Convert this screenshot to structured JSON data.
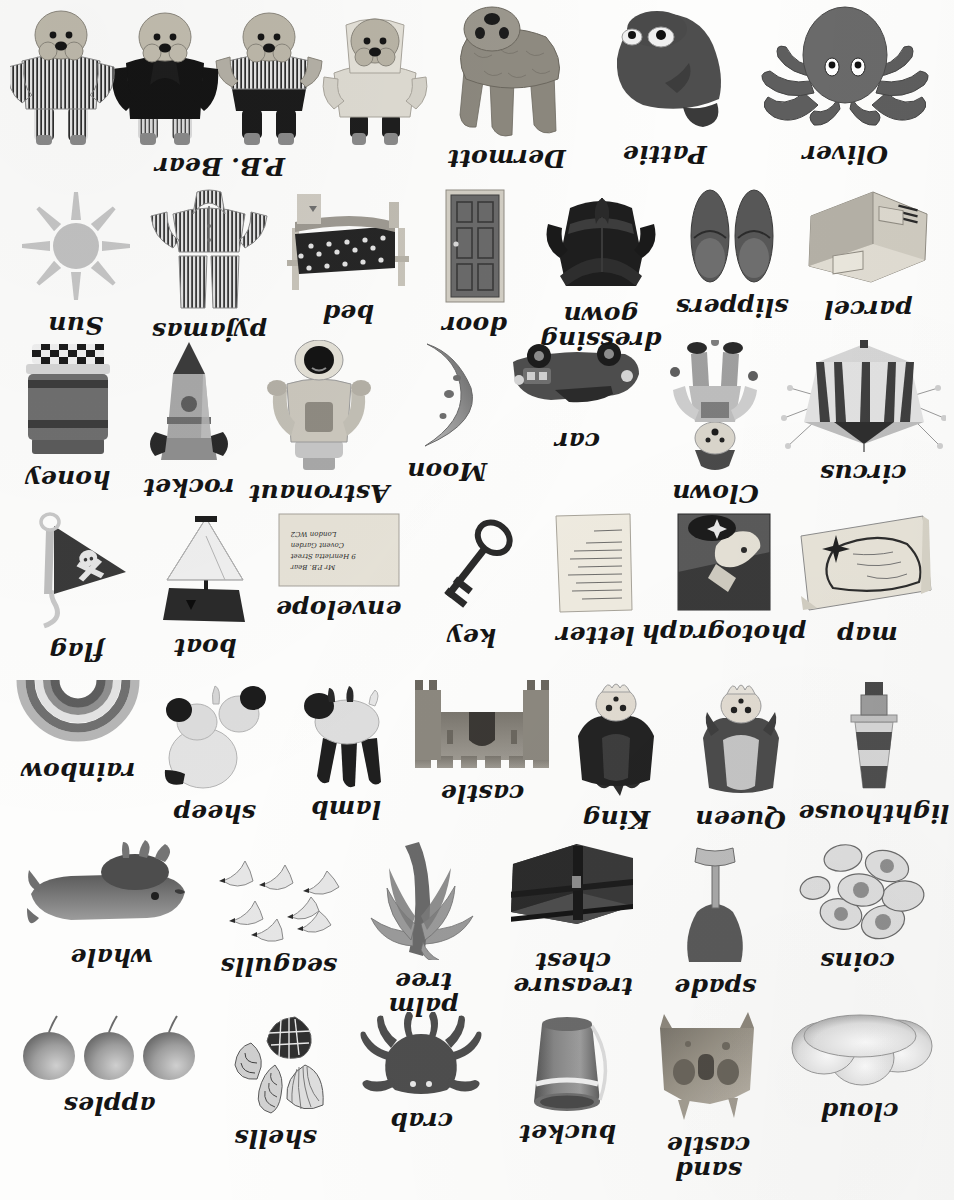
{
  "page": {
    "kind": "picture word list",
    "orientation": "upside-down scan",
    "columns_per_row": 7,
    "rows": 7
  },
  "envelope_address": {
    "line1": "Mr P.B. Bear",
    "line2": "9 Henrietta Street",
    "line3": "Covent Garden",
    "line4": "London WC2"
  },
  "rows": [
    {
      "id": "row-1",
      "items": [
        {
          "name": "cloud",
          "label": "cloud",
          "icon": "cloud-picture"
        },
        {
          "name": "sand-castle",
          "label": "sand\ncastle",
          "icon": "sandcastle-picture"
        },
        {
          "name": "bucket",
          "label": "bucket",
          "icon": "bucket-picture"
        },
        {
          "name": "crab",
          "label": "crab",
          "icon": "crab-picture"
        },
        {
          "name": "shells",
          "label": "shells",
          "icon": "shells-picture"
        },
        {
          "name": "apples",
          "label": "apples",
          "icon": "apples-picture"
        }
      ]
    },
    {
      "id": "row-2",
      "items": [
        {
          "name": "coins",
          "label": "coins",
          "icon": "coins-picture"
        },
        {
          "name": "spade",
          "label": "spade",
          "icon": "spade-picture"
        },
        {
          "name": "treasure-chest",
          "label": "treasure\nchest",
          "icon": "treasure-chest-picture"
        },
        {
          "name": "palm-tree",
          "label": "palm tree",
          "icon": "palm-tree-picture"
        },
        {
          "name": "seagulls",
          "label": "seagulls",
          "icon": "seagulls-picture"
        },
        {
          "name": "whale",
          "label": "whale",
          "icon": "whale-picture"
        }
      ]
    },
    {
      "id": "row-3",
      "items": [
        {
          "name": "lighthouse",
          "label": "lighthouse",
          "icon": "lighthouse-picture"
        },
        {
          "name": "queen",
          "label": "Queen",
          "icon": "queen-picture"
        },
        {
          "name": "king",
          "label": "King",
          "icon": "king-picture"
        },
        {
          "name": "castle",
          "label": "castle",
          "icon": "castle-picture"
        },
        {
          "name": "lamb",
          "label": "lamb",
          "icon": "lamb-picture"
        },
        {
          "name": "sheep",
          "label": "sheep",
          "icon": "sheep-picture"
        },
        {
          "name": "rainbow",
          "label": "rainbow",
          "icon": "rainbow-picture"
        }
      ]
    },
    {
      "id": "row-4",
      "items": [
        {
          "name": "map",
          "label": "map",
          "icon": "map-picture"
        },
        {
          "name": "photograph",
          "label": "photograph",
          "icon": "photograph-picture"
        },
        {
          "name": "letter",
          "label": "letter",
          "icon": "letter-picture"
        },
        {
          "name": "key",
          "label": "key",
          "icon": "key-picture"
        },
        {
          "name": "envelope",
          "label": "envelope",
          "icon": "envelope-picture"
        },
        {
          "name": "boat",
          "label": "boat",
          "icon": "boat-picture"
        },
        {
          "name": "flag",
          "label": "flag",
          "icon": "flag-picture"
        }
      ]
    },
    {
      "id": "row-5",
      "items": [
        {
          "name": "circus",
          "label": "circus",
          "icon": "circus-tent-picture"
        },
        {
          "name": "clown",
          "label": "Clown",
          "icon": "clown-picture"
        },
        {
          "name": "car",
          "label": "car",
          "icon": "car-picture"
        },
        {
          "name": "moon",
          "label": "Moon",
          "icon": "moon-picture"
        },
        {
          "name": "astronaut",
          "label": "Astronaut",
          "icon": "astronaut-picture"
        },
        {
          "name": "rocket",
          "label": "rocket",
          "icon": "rocket-picture"
        },
        {
          "name": "honey",
          "label": "honey",
          "icon": "honey-jar-picture"
        }
      ]
    },
    {
      "id": "row-6",
      "items": [
        {
          "name": "parcel",
          "label": "parcel",
          "icon": "parcel-picture"
        },
        {
          "name": "slippers",
          "label": "slippers",
          "icon": "slippers-picture"
        },
        {
          "name": "dressing-gown",
          "label": "dressing\ngown",
          "icon": "dressing-gown-picture"
        },
        {
          "name": "door",
          "label": "door",
          "icon": "door-picture"
        },
        {
          "name": "bed",
          "label": "bed",
          "icon": "bed-picture"
        },
        {
          "name": "pyjamas",
          "label": "pyjamas",
          "icon": "pyjamas-picture"
        },
        {
          "name": "sun",
          "label": "Sun",
          "icon": "sun-picture"
        }
      ]
    },
    {
      "id": "row-7",
      "items": [
        {
          "name": "oliver",
          "label": "Oliver",
          "icon": "oliver-octopus-picture"
        },
        {
          "name": "pattie",
          "label": "Pattie",
          "icon": "pattie-penguin-picture"
        },
        {
          "name": "dermott",
          "label": "Dermott",
          "icon": "dermott-dog-picture"
        },
        {
          "name": "pb-bear",
          "label": "P.B. Bear",
          "icon": "pb-bear-picture"
        }
      ]
    }
  ],
  "colors": {
    "paper": "#fdfdfc",
    "ink": "#141414",
    "midtone": "#8e8e8e",
    "dark": "#3a3a3a",
    "light": "#d4d4d4"
  }
}
